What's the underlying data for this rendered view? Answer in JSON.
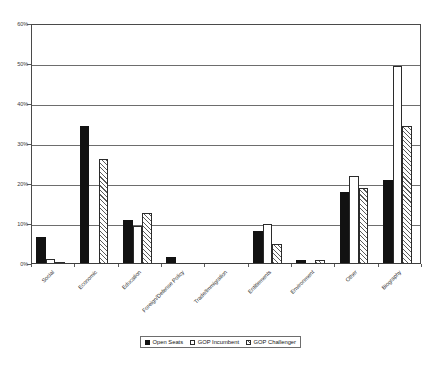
{
  "chart_data": {
    "type": "bar",
    "title": "",
    "subtitle": "",
    "xlabel": "",
    "ylabel": "",
    "ylim": [
      0,
      60
    ],
    "ytick_values": [
      0,
      10,
      20,
      30,
      40,
      50,
      60
    ],
    "ytick_labels": [
      "0%",
      "10%",
      "20%",
      "30%",
      "40%",
      "50%",
      "60%"
    ],
    "grid": true,
    "legend_position": "bottom",
    "categories": [
      "Social",
      "Economic",
      "Education",
      "Foreign/Defense Policy",
      "Trade/Immigration",
      "Entitlements",
      "Environment",
      "Other",
      "Biography"
    ],
    "series": [
      {
        "name": "Open Seats",
        "style": "solid-black",
        "values": [
          6.8,
          34.6,
          10.9,
          1.7,
          0,
          8.2,
          1.1,
          18.1,
          21.0
        ]
      },
      {
        "name": "GOP Incumbent",
        "style": "white-outline",
        "values": [
          1.2,
          0,
          9.6,
          0,
          0,
          10.0,
          0,
          22.1,
          49.6
        ]
      },
      {
        "name": "GOP Challenger",
        "style": "hatched",
        "values": [
          0.3,
          26.3,
          12.8,
          0,
          0,
          5.0,
          1.0,
          19.0,
          34.4
        ]
      }
    ]
  },
  "legend": {
    "items": [
      {
        "label": "Open Seats",
        "style": "open"
      },
      {
        "label": "GOP Incumbent",
        "style": "incumbent"
      },
      {
        "label": "GOP Challenger",
        "style": "challenger"
      }
    ]
  }
}
